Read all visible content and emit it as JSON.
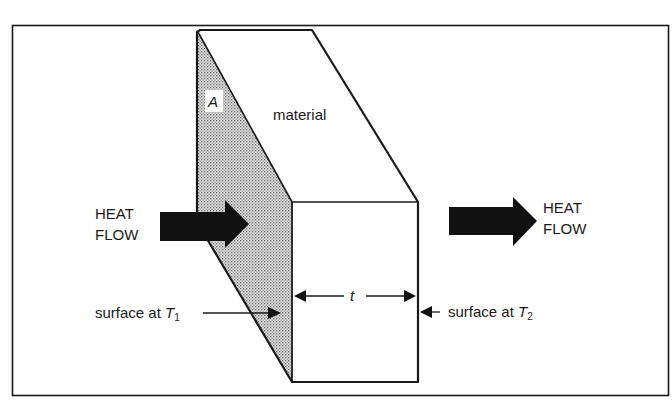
{
  "figure": {
    "colors": {
      "ink": "#1a1a1a",
      "background": "#ffffff",
      "shade_dot": "#555555"
    }
  },
  "labels": {
    "area": "A",
    "material": "material",
    "heat_flow_in_line1": "HEAT",
    "heat_flow_in_line2": "FLOW",
    "heat_flow_out_line1": "HEAT",
    "heat_flow_out_line2": "FLOW",
    "thickness": "t",
    "surface_left_prefix": "surface at ",
    "surface_left_var": "T",
    "surface_left_sub": "1",
    "surface_right_prefix": "surface at ",
    "surface_right_var": "T",
    "surface_right_sub": "2"
  },
  "icons": {
    "heat_in_arrow": "thick-right-arrow-icon",
    "heat_out_arrow": "thick-right-arrow-icon",
    "dimension_arrows": "double-headed-arrow-icon",
    "pointer_arrows": "pointer-arrow-icon"
  }
}
